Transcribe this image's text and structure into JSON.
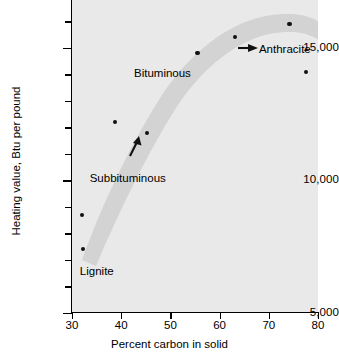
{
  "chart_data": {
    "type": "scatter",
    "title": "",
    "xlabel": "Percent carbon in solid",
    "ylabel": "Heating value, Btu per pound",
    "xlim": [
      30,
      80
    ],
    "ylim": [
      5000,
      16800
    ],
    "grid": false,
    "legend": "none",
    "xticks": [
      {
        "value": 30,
        "label": "30"
      },
      {
        "value": 40,
        "label": "40"
      },
      {
        "value": 50,
        "label": "50"
      },
      {
        "value": 60,
        "label": "60"
      },
      {
        "value": 70,
        "label": "70"
      },
      {
        "value": 80,
        "label": "80"
      }
    ],
    "yticks_major": [
      {
        "value": 5000,
        "label": "5,000"
      },
      {
        "value": 10000,
        "label": "10,000"
      },
      {
        "value": 15000,
        "label": "15,000"
      }
    ],
    "yticks_minor": [
      6000,
      7000,
      8000,
      9000,
      11000,
      12000,
      13000,
      14000,
      16000
    ],
    "points": [
      {
        "x": 32.0,
        "y": 8700
      },
      {
        "x": 32.3,
        "y": 7400
      },
      {
        "x": 38.8,
        "y": 12200
      },
      {
        "x": 45.3,
        "y": 11800
      },
      {
        "x": 55.5,
        "y": 14800
      },
      {
        "x": 63.1,
        "y": 15400
      },
      {
        "x": 74.2,
        "y": 15900
      },
      {
        "x": 77.6,
        "y": 14100
      }
    ],
    "trend_band": {
      "description": "shaded grey band rising steeply from lignite through subbituminous and bituminous, peaking near 65 percent carbon then declining toward anthracite",
      "color": "#d0d0d0"
    },
    "annotations": [
      {
        "text": "Lignite",
        "x": 31.6,
        "y": 6550
      },
      {
        "text": "Subbituminous",
        "x": 33.6,
        "y": 10050
      },
      {
        "text": "Bituminous",
        "x": 42.6,
        "y": 14000
      },
      {
        "text": "Anthracite",
        "x": 68.0,
        "y": 14900
      }
    ],
    "arrows": [
      {
        "name": "arrow-up-subbituminous",
        "x": 42.5,
        "y": 11550,
        "direction": "up-right"
      },
      {
        "name": "arrow-right-anthracite",
        "x": 66.5,
        "y": 15450,
        "direction": "right"
      }
    ]
  }
}
